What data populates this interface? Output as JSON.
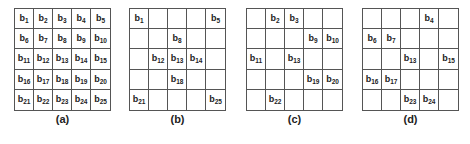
{
  "figure": {
    "panels": [
      {
        "id": "a",
        "caption": "(a)",
        "cells": [
          "1",
          "2",
          "3",
          "4",
          "5",
          "6",
          "7",
          "8",
          "9",
          "10",
          "11",
          "12",
          "13",
          "14",
          "15",
          "16",
          "17",
          "18",
          "19",
          "20",
          "21",
          "22",
          "23",
          "24",
          "25"
        ]
      },
      {
        "id": "b",
        "caption": "(b)",
        "cells": [
          "1",
          "",
          "",
          "",
          "5",
          "",
          "",
          "8",
          "",
          "",
          "",
          "12",
          "13",
          "14",
          "",
          "",
          "",
          "18",
          "",
          "",
          "21",
          "",
          "",
          "",
          "25"
        ]
      },
      {
        "id": "c",
        "caption": "(c)",
        "cells": [
          "",
          "2",
          "3",
          "",
          "",
          "",
          "",
          "",
          "9",
          "10",
          "11",
          "",
          "13",
          "",
          "",
          "",
          "",
          "",
          "19",
          "20",
          "",
          "22",
          "",
          "",
          ""
        ]
      },
      {
        "id": "d",
        "caption": "(d)",
        "cells": [
          "",
          "",
          "",
          "4",
          "",
          "6",
          "7",
          "",
          "",
          "",
          "",
          "",
          "13",
          "",
          "15",
          "16",
          "17",
          "",
          "",
          "",
          "",
          "",
          "23",
          "24",
          ""
        ]
      }
    ],
    "symbol_prefix": "b"
  }
}
